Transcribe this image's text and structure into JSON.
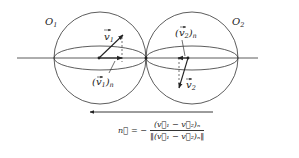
{
  "diagram": {
    "spheres": [
      {
        "id": "O1",
        "label": "O",
        "label_sub": "1"
      },
      {
        "id": "O2",
        "label": "O",
        "label_sub": "2"
      }
    ],
    "vectors": {
      "v1": {
        "label": "v",
        "label_sub": "1"
      },
      "v1n": {
        "label": "(v",
        "label_sub": "1",
        "label_suffix": ")",
        "suffix_sub": "n"
      },
      "v2": {
        "label": "v",
        "label_sub": "2"
      },
      "v2n": {
        "label": "(v",
        "label_sub": "2",
        "label_suffix": ")",
        "suffix_sub": "n"
      }
    },
    "formula": {
      "lhs": "n⃗",
      "equals": "= −",
      "numerator": "(v⃗₁ − v⃗₂)ₙ",
      "denominator": "‖(v⃗₁ − v⃗₂)ₙ‖"
    },
    "colors": {
      "stroke": "#333333",
      "text": "#222222",
      "background": "#ffffff"
    }
  }
}
